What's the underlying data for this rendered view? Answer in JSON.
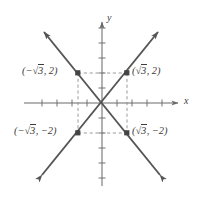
{
  "figure": {
    "background_color": "#ffffff",
    "stroke_color": "#555555",
    "axis_color": "#6b6b6b",
    "dash_color": "#8a8a8a",
    "text_color": "#3d3d3d",
    "width": 202,
    "height": 198
  },
  "axes": {
    "x_label": "x",
    "y_label": "y",
    "origin_px": [
      102,
      103
    ],
    "tick_spacing_px": 15,
    "x_ticks": [
      -4,
      -3,
      -2,
      -1,
      1,
      2,
      3,
      4
    ],
    "y_ticks": [
      -5,
      -4,
      -3,
      -2,
      -1,
      1,
      2,
      3,
      4,
      5
    ],
    "x_arrow": "right",
    "y_arrow": "up"
  },
  "points": [
    {
      "id": "top-left",
      "label_prefix": "(−",
      "label_radicand": "3",
      "label_suffix": ", 2)",
      "x_value": "-√3",
      "y_value": "2",
      "px": [
        78,
        73
      ]
    },
    {
      "id": "top-right",
      "label_prefix": "(",
      "label_radicand": "3",
      "label_suffix": ", 2)",
      "x_value": "√3",
      "y_value": "2",
      "px": [
        127,
        73
      ]
    },
    {
      "id": "bottom-left",
      "label_prefix": "(−",
      "label_radicand": "3",
      "label_suffix": ", −2)",
      "x_value": "-√3",
      "y_value": "-2",
      "px": [
        78,
        133
      ]
    },
    {
      "id": "bottom-right",
      "label_prefix": "(",
      "label_radicand": "3",
      "label_suffix": ", −2)",
      "x_value": "√3",
      "y_value": "-2",
      "px": [
        127,
        133
      ]
    }
  ],
  "lines": [
    {
      "id": "rising-line",
      "description": "line with positive slope through origin and (√3, 2)",
      "from_px": [
        42,
        175
      ],
      "to_px": [
        158,
        32
      ],
      "arrows": "both"
    },
    {
      "id": "falling-line",
      "description": "line with negative slope through origin and (−√3, 2)",
      "from_px": [
        44,
        32
      ],
      "to_px": [
        160,
        175
      ],
      "arrows": "both"
    }
  ],
  "dashed_rectangle": {
    "description": "dashed rectangle connecting the four labeled points",
    "left_px": 78,
    "right_px": 127,
    "top_px": 73,
    "bottom_px": 133
  }
}
